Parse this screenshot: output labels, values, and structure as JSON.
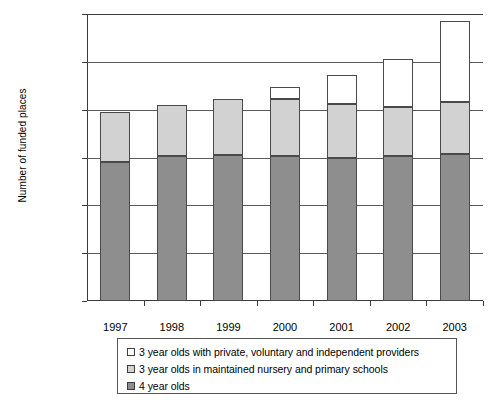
{
  "chart_data": {
    "type": "bar",
    "subtype": "stacked",
    "title": "",
    "xlabel": "",
    "ylabel": "Number of funded places",
    "ylim": [
      0,
      1200000
    ],
    "ytick_values": [
      0,
      200000,
      400000,
      600000,
      800000,
      1000000,
      1200000
    ],
    "ytick_labels": [
      "0",
      "200,000",
      "400,000",
      "600,000",
      "800,000",
      "1,000,000",
      "1,200,000"
    ],
    "grid": true,
    "grid_axis": "y",
    "legend_position": "below",
    "categories": [
      "1997",
      "1998",
      "1999",
      "2000",
      "2001",
      "2002",
      "2003"
    ],
    "series": [
      {
        "name": "4 year olds",
        "color": "#8e8e8e",
        "values": [
          580000,
          605000,
          610000,
          605000,
          600000,
          605000,
          615000
        ]
      },
      {
        "name": "3 year olds in maintained nursery and primary schools",
        "color": "#d2d2d2",
        "values": [
          210000,
          215000,
          233000,
          238000,
          225000,
          208000,
          215000
        ]
      },
      {
        "name": "3 year olds with private, voluntary and independent providers",
        "color": "#ffffff",
        "values": [
          0,
          0,
          0,
          50000,
          118000,
          197000,
          340000
        ]
      }
    ],
    "totals": [
      790000,
      820000,
      843000,
      893000,
      943000,
      1010000,
      1170000
    ]
  },
  "axes": {
    "y_title": "Number of funded places"
  },
  "legend": {
    "items": [
      {
        "label": "3 year olds with private, voluntary and independent providers",
        "swatch": "white"
      },
      {
        "label": "3 year olds in maintained nursery and primary schools",
        "swatch": "light"
      },
      {
        "label": "4 year olds",
        "swatch": "dark"
      }
    ]
  },
  "colors": {
    "white_segment": "#ffffff",
    "light_segment": "#d2d2d2",
    "dark_segment": "#8e8e8e",
    "axis": "#3a3a3a",
    "grid": "#5a5a5a"
  }
}
